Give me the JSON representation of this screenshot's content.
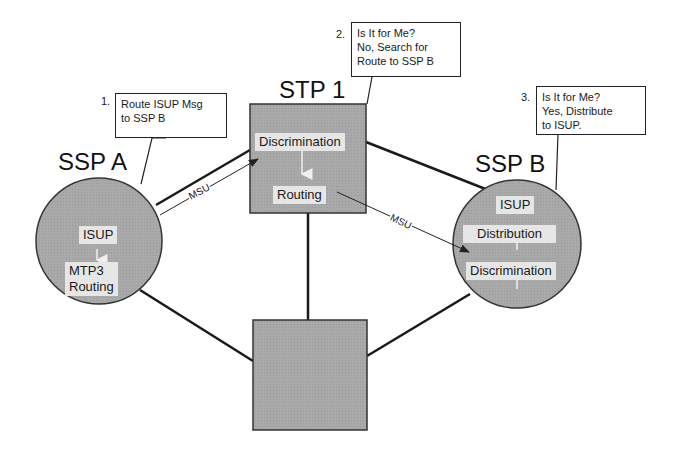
{
  "nodes": {
    "ssp_a": {
      "title": "SSP A",
      "layers": [
        "ISUP",
        "MTP3\nRouting"
      ]
    },
    "stp_1": {
      "title": "STP 1",
      "layers": [
        "Discrimination",
        "Routing"
      ]
    },
    "ssp_b": {
      "title": "SSP B",
      "layers": [
        "ISUP",
        "Distribution",
        "Discrimination"
      ]
    },
    "stp_2": {
      "title": ""
    }
  },
  "callouts": [
    {
      "number": "1.",
      "lines": [
        "Route ISUP Msg",
        "to SSP B"
      ]
    },
    {
      "number": "2.",
      "lines": [
        "Is It for Me?",
        "No, Search for",
        "Route to SSP B"
      ]
    },
    {
      "number": "3.",
      "lines": [
        "Is It for Me?",
        "Yes, Distribute",
        "to ISUP."
      ]
    }
  ],
  "messages": {
    "msu_1": "MSU",
    "msu_2": "MSU"
  },
  "colors": {
    "node_fill": "#a8a8a8",
    "chip_fill": "#e6e6e6",
    "line": "#1a1a1a"
  }
}
